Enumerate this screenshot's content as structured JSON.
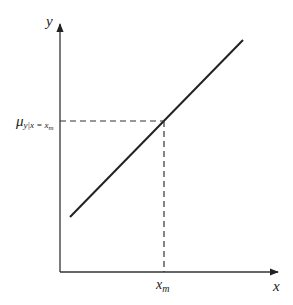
{
  "diagram": {
    "type": "regression-line",
    "axes": {
      "x_label": "x",
      "y_label": "y"
    },
    "line": {
      "start": [
        70,
        217
      ],
      "end": [
        243,
        40
      ],
      "color": "#222222"
    },
    "point": {
      "x_label": "x",
      "x_label_sub": "m",
      "y_label_mu": "μ",
      "y_label_sub": "y|x = x",
      "y_label_sub2": "m"
    },
    "colors": {
      "axis": "#333333",
      "dash": "#333333",
      "line": "#222222"
    }
  }
}
